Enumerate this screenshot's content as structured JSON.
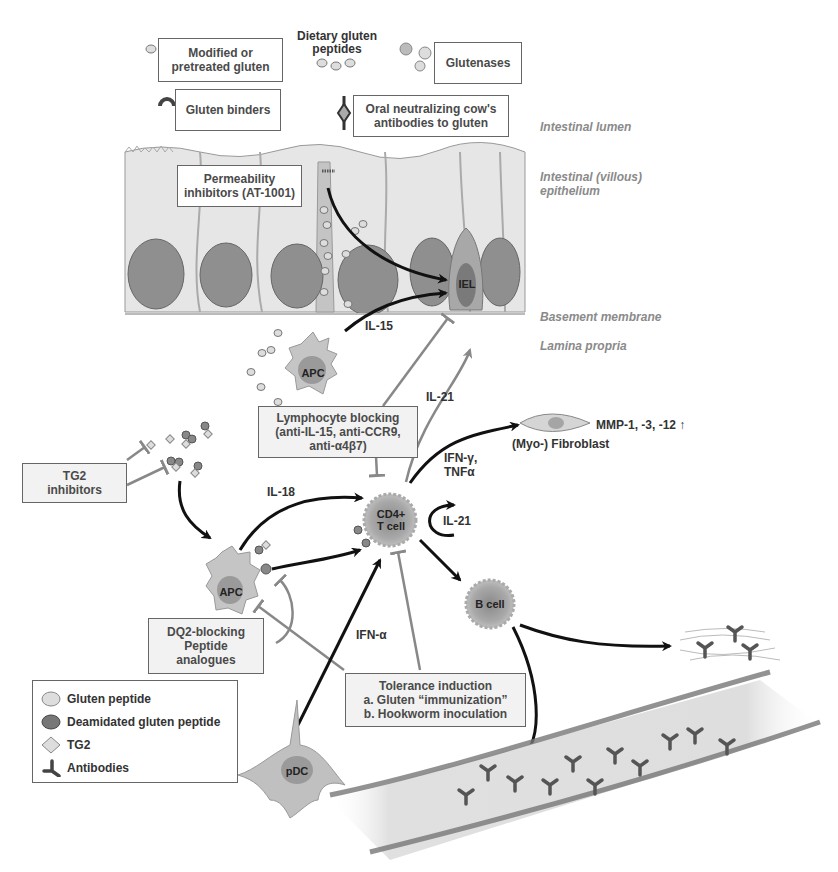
{
  "zones": {
    "lumen": "Intestinal lumen",
    "epithelium_1": "Intestinal (villous)",
    "epithelium_2": "epithelium",
    "basement": "Basement membrane",
    "lamina": "Lamina propria"
  },
  "top": {
    "dietary_1": "Dietary gluten",
    "dietary_2": "peptides",
    "modified_1": "Modified or",
    "modified_2": "pretreated gluten",
    "glutenases": "Glutenases",
    "binders": "Gluten binders",
    "oral_1": "Oral neutralizing cow's",
    "oral_2": "antibodies to gluten"
  },
  "boxes": {
    "permeability_1": "Permeability",
    "permeability_2": "inhibitors (AT-1001)",
    "lymph_1": "Lymphocyte blocking",
    "lymph_2": "(anti-IL-15, anti-CCR9,",
    "lymph_3": "anti-α4β7)",
    "tg2_1": "TG2",
    "tg2_2": "inhibitors",
    "dq2_1": "DQ2-blocking",
    "dq2_2": "Peptide",
    "dq2_3": "analogues",
    "tol_1": "Tolerance induction",
    "tol_2": "a. Gluten “immunization”",
    "tol_3": "b. Hookworm inoculation"
  },
  "cells": {
    "iel": "IEL",
    "apc_top": "APC",
    "apc_mid": "APC",
    "cd4_1": "CD4+",
    "cd4_2": "T cell",
    "bcell": "B cell",
    "pdc": "pDC",
    "fibroblast": "(Myo-) Fibroblast"
  },
  "signals": {
    "il15": "IL-15",
    "il21_up": "IL-21",
    "il21_loop": "IL-21",
    "il18": "IL-18",
    "ifn_g_1": "IFN-γ,",
    "ifn_g_2": "TNFα",
    "ifn_a": "IFN-α",
    "mmp": "MMP-1, -3, -12 ↑"
  },
  "legend": {
    "items": [
      {
        "icon": "gluten-peptide-icon",
        "label": "Gluten peptide"
      },
      {
        "icon": "deamidated-peptide-icon",
        "label": "Deamidated gluten peptide"
      },
      {
        "icon": "tg2-icon",
        "label": "TG2"
      },
      {
        "icon": "antibody-icon",
        "label": "Antibodies"
      }
    ]
  },
  "colors": {
    "cell_fill": "#c8c8c8",
    "nucleus": "#8e8e8e",
    "arrow_black": "#111111",
    "arrow_gray": "#8a8a8a",
    "box_bg": "#f2f2f2"
  }
}
